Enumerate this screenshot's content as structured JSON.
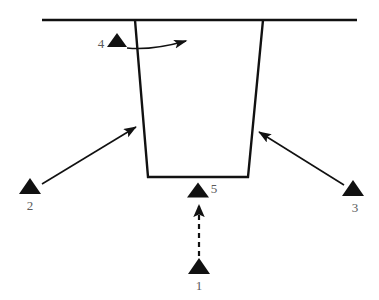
{
  "diagram": {
    "background_color": "#ffffff",
    "line_color": "#111111",
    "label_color": "#5a5a5a",
    "ground_line": {
      "name": "ground-surface-line",
      "x1": 42,
      "y1": 20,
      "x2": 357,
      "y2": 20,
      "stroke_width": 2.6
    },
    "trench": {
      "name": "trench-outline",
      "top_left_x": 135,
      "top_right_x": 263,
      "bottom_left_x": 148,
      "bottom_right_x": 248,
      "top_y": 20,
      "bottom_y": 177,
      "stroke_width": 2.4
    },
    "markers": [
      {
        "id": "1",
        "label": "1",
        "name": "marker-triangle-1",
        "triangle": {
          "cx": 199,
          "cy": 266,
          "half_width": 11,
          "height": 16
        },
        "label_x": 199,
        "label_y": 287,
        "label_anchor": "middle"
      },
      {
        "id": "2",
        "label": "2",
        "name": "marker-triangle-2",
        "triangle": {
          "cx": 30,
          "cy": 186,
          "half_width": 11,
          "height": 16
        },
        "label_x": 30,
        "label_y": 207,
        "label_anchor": "middle"
      },
      {
        "id": "3",
        "label": "3",
        "name": "marker-triangle-3",
        "triangle": {
          "cx": 353,
          "cy": 188,
          "half_width": 11,
          "height": 16
        },
        "label_x": 355,
        "label_y": 209,
        "label_anchor": "middle"
      },
      {
        "id": "4",
        "label": "4",
        "name": "marker-triangle-4",
        "triangle": {
          "cx": 117,
          "cy": 40,
          "half_width": 10,
          "height": 14
        },
        "label_x": 101,
        "label_y": 45,
        "label_anchor": "middle"
      },
      {
        "id": "5",
        "label": "5",
        "name": "marker-triangle-5",
        "triangle": {
          "cx": 198,
          "cy": 190,
          "half_width": 11,
          "height": 15
        },
        "label_x": 214,
        "label_y": 190,
        "label_anchor": "middle"
      }
    ],
    "arrows": [
      {
        "name": "pointer-arrow-from-2",
        "style": "solid",
        "x1": 42,
        "y1": 184,
        "x2": 136,
        "y2": 127,
        "stroke_width": 1.6,
        "head": "filled"
      },
      {
        "name": "pointer-arrow-from-3",
        "style": "solid",
        "x1": 344,
        "y1": 185,
        "x2": 259,
        "y2": 132,
        "stroke_width": 1.6,
        "head": "filled"
      },
      {
        "name": "direction-arrow-dashed-1-to-5",
        "style": "dashed",
        "x1": 199,
        "y1": 256,
        "x2": 199,
        "y2": 205,
        "stroke_width": 2.2,
        "dash_pattern": "5,4",
        "head": "filled"
      },
      {
        "name": "curved-flow-arrow-from-4",
        "style": "curved",
        "path": "M 127,48 C 145,50 168,46 186,41",
        "stroke_width": 1.5,
        "head": "filled"
      }
    ]
  }
}
